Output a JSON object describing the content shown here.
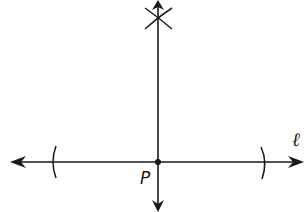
{
  "diagram": {
    "type": "geometric-construction",
    "labels": {
      "point": "P",
      "line": "ℓ"
    },
    "colors": {
      "stroke": "#1a1a1a",
      "background": "#ffffff"
    },
    "elements": [
      {
        "name": "line-l",
        "kind": "line",
        "orientation": "horizontal",
        "arrows": "both"
      },
      {
        "name": "perpendicular-line",
        "kind": "line",
        "orientation": "vertical",
        "arrows": "both"
      },
      {
        "name": "point-p",
        "kind": "point"
      },
      {
        "name": "arc-left",
        "kind": "arc"
      },
      {
        "name": "arc-right",
        "kind": "arc"
      },
      {
        "name": "intersecting-arcs",
        "kind": "arc-pair",
        "shape": "X"
      }
    ]
  }
}
